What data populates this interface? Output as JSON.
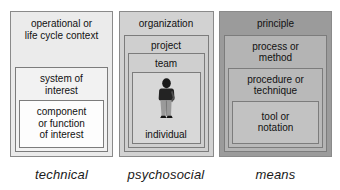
{
  "diagram": {
    "columns": [
      {
        "caption": "technical",
        "levels": [
          {
            "label": "operational or\nlife cycle context"
          },
          {
            "label": "system of\ninterest"
          },
          {
            "label": "component\nor function\nof interest"
          }
        ]
      },
      {
        "caption": "psychosocial",
        "levels": [
          {
            "label": "organization"
          },
          {
            "label": "project"
          },
          {
            "label": "team"
          },
          {
            "label": "individual"
          }
        ],
        "figure_icon": "person-standing-icon"
      },
      {
        "caption": "means",
        "levels": [
          {
            "label": "principle"
          },
          {
            "label": "process or\nmethod"
          },
          {
            "label": "procedure or\ntechnique"
          },
          {
            "label": "tool or\nnotation"
          }
        ]
      }
    ]
  },
  "colors": {
    "technical_panel": "#ebebeb",
    "psychosocial_panel": "#d2d2d2",
    "means_panel": "#9b9b9b",
    "border": "#7c7c7c",
    "text": "#111111",
    "background": "#ffffff"
  }
}
